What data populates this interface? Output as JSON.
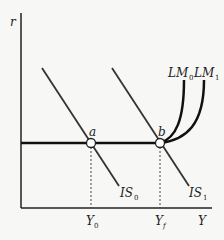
{
  "diagram": {
    "axes": {
      "y_label": "r",
      "x_label": "Y"
    },
    "curves": {
      "is0": {
        "label": "IS",
        "subscript": "0"
      },
      "is1": {
        "label": "IS",
        "subscript": "1"
      },
      "lm0": {
        "label": "LM",
        "subscript": "0"
      },
      "lm1": {
        "label": "LM",
        "subscript": "1"
      }
    },
    "points": {
      "a": {
        "label": "a"
      },
      "b": {
        "label": "b"
      }
    },
    "x_ticks": {
      "y0": {
        "label": "Y",
        "subscript": "0"
      },
      "yf": {
        "label": "Y",
        "subscript": "f"
      }
    },
    "colors": {
      "line": "#222222",
      "background": "#f7f7f5"
    }
  }
}
